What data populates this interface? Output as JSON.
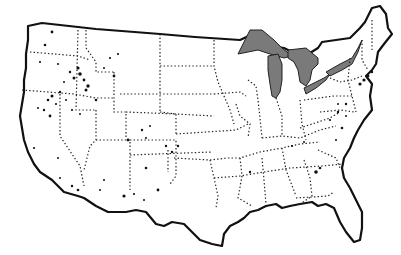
{
  "map": {
    "title": "",
    "region": "Contiguous United States",
    "style": "black-and-white outline map with dotted state borders",
    "colors": {
      "background": "#ffffff",
      "outline": "#111111",
      "state_borders": "#222222",
      "great_lakes": "#7a7a7a",
      "points": "#111111"
    },
    "shaded_features": [
      "Lake Superior",
      "Lake Michigan",
      "Lake Huron",
      "Lake Erie",
      "Lake Ontario",
      "St. Lawrence River"
    ],
    "point_markers": {
      "symbol": "dot",
      "description": "scattered location dots, concentrated in the western mountain states, Pacific coast, and northeastern seaboard"
    },
    "labels": []
  }
}
